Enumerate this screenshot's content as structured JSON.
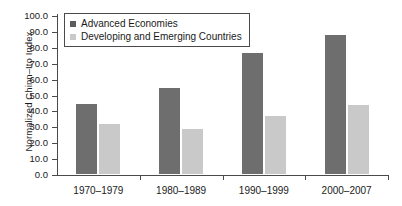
{
  "chart_data": {
    "type": "bar",
    "title": "",
    "xlabel": "",
    "ylabel": "Normalized Chinn–Ito Index",
    "categories": [
      "1970–1979",
      "1980–1989",
      "1990–1999",
      "2000–2007"
    ],
    "series": [
      {
        "name": "Advanced Economies",
        "color": "#6e6e6e",
        "values": [
          45.0,
          55.5,
          77.5,
          89.0
        ]
      },
      {
        "name": "Developing and Emerging Countries",
        "color": "#c9c9c9",
        "values": [
          32.5,
          29.5,
          37.5,
          44.5
        ]
      }
    ],
    "ylim": [
      0.0,
      100.0
    ],
    "ytick_step": 10.0,
    "ytick_labels": [
      "100.0",
      "90.0",
      "80.0",
      "70.0",
      "60.0",
      "50.0",
      "40.0",
      "30.0",
      "20.0",
      "10.0",
      "0.0"
    ],
    "grid": false,
    "legend_position": "top-left"
  }
}
